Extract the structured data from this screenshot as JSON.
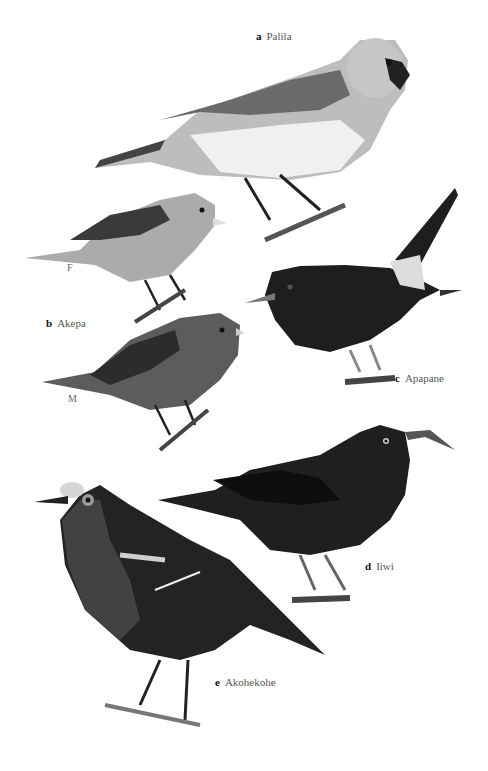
{
  "plate": {
    "birds": [
      {
        "letter": "a",
        "name": "Palila"
      },
      {
        "letter": "b",
        "name": "Akepa",
        "variants": [
          "F",
          "M"
        ]
      },
      {
        "letter": "c",
        "name": "Apapane"
      },
      {
        "letter": "d",
        "name": "Iiwi"
      },
      {
        "letter": "e",
        "name": "Akohekohe"
      }
    ]
  },
  "colors": {
    "background": "#ffffff",
    "palila_head": "#b8b8b8",
    "palila_belly": "#f2f2f2",
    "dark_bird": "#1e1e1e",
    "akepa_f": "#a8a8a8",
    "akepa_m": "#5a5a5a"
  }
}
